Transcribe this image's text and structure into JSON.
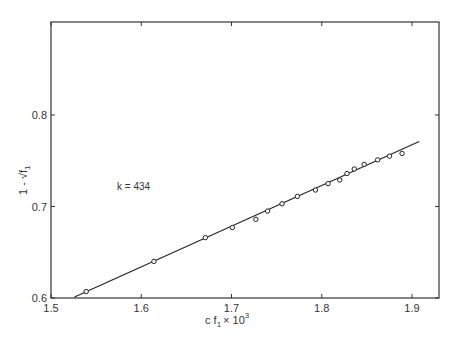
{
  "chart_data": {
    "type": "scatter",
    "title": "",
    "xlabel": "c f1 × 10^3",
    "ylabel": "1 - √f1",
    "xlim": [
      1.5,
      1.93
    ],
    "ylim": [
      0.6,
      0.9
    ],
    "x_ticks": [
      "1.5",
      "1.6",
      "1.7",
      "1.8",
      "1.9"
    ],
    "y_ticks": [
      "0.6",
      "0.7",
      "0.8"
    ],
    "grid": false,
    "legend": null,
    "annotations": [
      "k = 434"
    ],
    "series": [
      {
        "name": "data",
        "marker": "open-circle",
        "x": [
          1.539,
          1.614,
          1.671,
          1.701,
          1.727,
          1.74,
          1.756,
          1.773,
          1.793,
          1.807,
          1.82,
          1.828,
          1.836,
          1.847,
          1.862,
          1.875,
          1.889
        ],
        "y": [
          0.607,
          0.64,
          0.666,
          0.677,
          0.686,
          0.695,
          0.703,
          0.711,
          0.718,
          0.725,
          0.729,
          0.736,
          0.741,
          0.746,
          0.751,
          0.755,
          0.758
        ]
      },
      {
        "name": "fit",
        "style": "line",
        "x": [
          1.526,
          1.908
        ],
        "y": [
          0.601,
          0.771
        ]
      }
    ]
  },
  "labels": {
    "xlabel_main": "c f",
    "xlabel_sub": "1",
    "xlabel_times": "× 10",
    "xlabel_sup": "3",
    "ylabel_main": "1 - √f",
    "ylabel_sub": "1",
    "annotation": "k = 434"
  }
}
